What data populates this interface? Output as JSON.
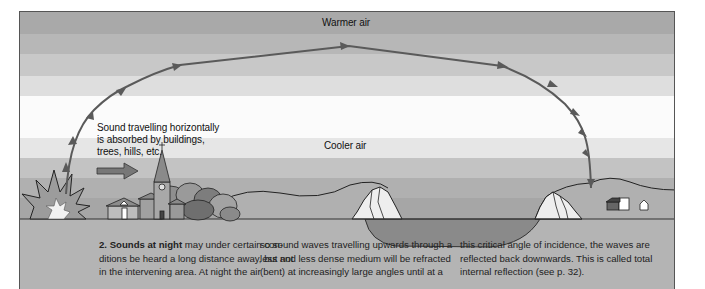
{
  "diagram": {
    "title_label": "Warmer air",
    "cooler_label": "Cooler air",
    "horizontal_label_lines": [
      "Sound travelling horizontally",
      "is absorbed by buildings,",
      "trees, hills, etc."
    ],
    "bands": [
      {
        "name": "band-1",
        "color": "#a9a9a9"
      },
      {
        "name": "band-2",
        "color": "#b7b7b7"
      },
      {
        "name": "band-3",
        "color": "#c8c8c8"
      },
      {
        "name": "band-4",
        "color": "#dedede"
      },
      {
        "name": "band-5",
        "color": "#fbfbfb"
      },
      {
        "name": "band-6",
        "color": "#e6e6e6"
      },
      {
        "name": "band-7",
        "color": "#c3c3c3"
      },
      {
        "name": "band-8",
        "color": "#b0b0b0"
      },
      {
        "name": "band-9",
        "color": "#a6a6a6"
      }
    ],
    "ground_color": "#b4b4b4",
    "water_color": "#8a8a8a",
    "path_color": "#5a5a5a"
  },
  "caption": {
    "col1": {
      "bold": "2. Sounds at night",
      "line1_rest": " may under certain con-",
      "line2": "ditions be heard a long distance away, but not",
      "line3": "in the intervening area. At night the air"
    },
    "col2": {
      "line1": "so sound waves travelling upwards through a",
      "line2": "less and less dense medium will be refracted",
      "line3": "(bent) at increasingly large angles until at a"
    },
    "col3": {
      "line1": "this critical angle of incidence, the waves are",
      "line2": "reflected back downwards. This is called total",
      "line3": "internal reflection (see p. 32)."
    }
  }
}
